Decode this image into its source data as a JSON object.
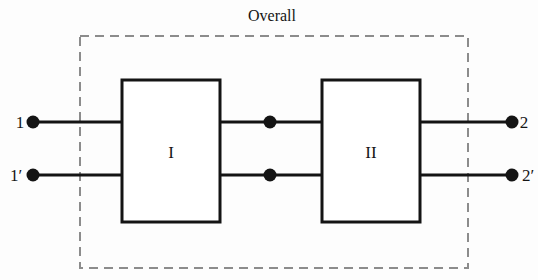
{
  "diagram": {
    "title": "Overall",
    "background_color": "#fdfdfd",
    "line_color": "#141414",
    "dashed_border_color": "#8c8c8c",
    "blocks": [
      {
        "id": "block-1",
        "label": "I",
        "x": 122,
        "y": 80,
        "width": 98,
        "height": 142
      },
      {
        "id": "block-2",
        "label": "II",
        "x": 322,
        "y": 80,
        "width": 98,
        "height": 142
      }
    ],
    "ports": [
      {
        "id": "port-1",
        "label": "1",
        "label_x": 16,
        "label_y": 128,
        "dot_x": 33,
        "dot_y": 122
      },
      {
        "id": "port-1-prime",
        "label": "1′",
        "label_x": 8,
        "label_y": 181,
        "dot_x": 33,
        "dot_y": 175
      },
      {
        "id": "port-2",
        "label": "2",
        "label_x": 521,
        "label_y": 128,
        "dot_x": 512,
        "dot_y": 122
      },
      {
        "id": "port-2-prime",
        "label": "2′",
        "label_x": 521,
        "label_y": 181,
        "dot_x": 512,
        "dot_y": 175
      }
    ],
    "junctions": [
      {
        "id": "junction-top",
        "x": 270,
        "y": 122
      },
      {
        "id": "junction-bottom",
        "x": 270,
        "y": 175
      }
    ],
    "wires": [
      {
        "id": "wire-in-top",
        "x1": 33,
        "y1": 122,
        "x2": 122,
        "y2": 122
      },
      {
        "id": "wire-in-bottom",
        "x1": 33,
        "y1": 175,
        "x2": 122,
        "y2": 175
      },
      {
        "id": "wire-mid-top",
        "x1": 220,
        "y1": 122,
        "x2": 322,
        "y2": 122
      },
      {
        "id": "wire-mid-bottom",
        "x1": 220,
        "y1": 175,
        "x2": 322,
        "y2": 175
      },
      {
        "id": "wire-out-top",
        "x1": 420,
        "y1": 122,
        "x2": 512,
        "y2": 122
      },
      {
        "id": "wire-out-bottom",
        "x1": 420,
        "y1": 175,
        "x2": 512,
        "y2": 175
      }
    ],
    "enclosure": {
      "x": 80,
      "y": 36,
      "width": 388,
      "height": 232
    },
    "title_position": {
      "x": 272,
      "y": 21
    }
  }
}
